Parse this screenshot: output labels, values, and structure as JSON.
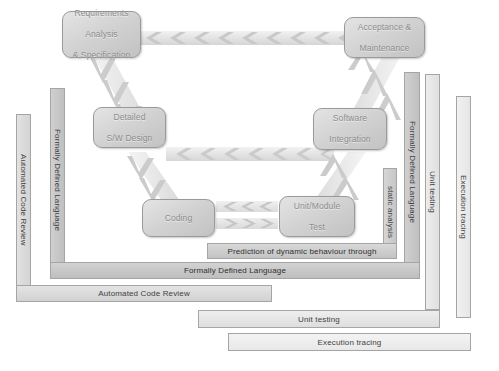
{
  "diagram": {
    "colors": {
      "box_fill": "#d3d3d3",
      "box_border": "#9a9a9a",
      "box_text": "#8c8c8c",
      "bracket_border": "#a5a5a5",
      "bracket_text": "#3f3f3f",
      "arrow_band": "#e8e8e8",
      "background": "#ffffff"
    },
    "phases": [
      {
        "id": "requirements",
        "label": "Requirements\nAnalysis\n& Specification",
        "lines": [
          "Requirements",
          "Analysis",
          "& Specification"
        ]
      },
      {
        "id": "detailed-design",
        "label": "Detailed\nS/W Design",
        "lines": [
          "Detailed",
          "S/W Design"
        ]
      },
      {
        "id": "coding",
        "label": "Coding",
        "lines": [
          "Coding"
        ]
      },
      {
        "id": "unit-module-test",
        "label": "Unit/Module\nTest",
        "lines": [
          "Unit/Module",
          "Test"
        ]
      },
      {
        "id": "software-integration",
        "label": "Software\nIntegration",
        "lines": [
          "Software",
          "Integration"
        ]
      },
      {
        "id": "acceptance-maintenance",
        "label": "Acceptance &\nMaintenance",
        "lines": [
          "Acceptance &",
          "Maintenance"
        ]
      }
    ],
    "brackets": [
      {
        "id": "prediction",
        "left_label": "",
        "bottom_label": "Prediction of dynamic behaviour through",
        "right_label": "static analysis"
      },
      {
        "id": "formally-defined-language",
        "left_label": "Formally Defined Language",
        "bottom_label": "Formally Defined Language",
        "right_label": "Formally Defined Language"
      },
      {
        "id": "automated-code-review",
        "left_label": "Automated Code Review",
        "bottom_label": "Automated Code Review",
        "right_label": ""
      },
      {
        "id": "unit-testing",
        "left_label": "",
        "bottom_label": "Unit testing",
        "right_label": "Unit testing"
      },
      {
        "id": "execution-tracing",
        "left_label": "",
        "bottom_label": "Execution tracing",
        "right_label": "Execution tracing"
      }
    ],
    "arrows": [
      {
        "id": "acceptance-to-requirements",
        "direction": "left",
        "orientation": "horizontal",
        "chevrons": 9
      },
      {
        "id": "integration-to-detailed-design",
        "direction": "left",
        "orientation": "horizontal",
        "chevrons": 7
      },
      {
        "id": "unit-test-to-coding",
        "direction": "left",
        "orientation": "horizontal",
        "chevrons": 4
      },
      {
        "id": "coding-to-unit-test",
        "direction": "right",
        "orientation": "horizontal",
        "chevrons": 4
      },
      {
        "id": "requirements-to-detailed-design",
        "direction": "down",
        "orientation": "diagonal",
        "chevrons": 3
      },
      {
        "id": "detailed-design-to-coding",
        "direction": "down",
        "orientation": "diagonal",
        "chevrons": 3
      },
      {
        "id": "unit-test-to-integration",
        "direction": "up",
        "orientation": "diagonal",
        "chevrons": 3
      },
      {
        "id": "integration-to-acceptance",
        "direction": "up",
        "orientation": "diagonal",
        "chevrons": 3
      }
    ]
  }
}
